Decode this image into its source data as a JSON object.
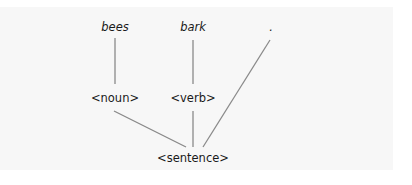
{
  "diagram": {
    "type": "parse-tree",
    "colors": {
      "background": "#ffffff",
      "panel": "#f7f7f7",
      "edge": "#8a8a8a",
      "text": "#1a1a1a"
    },
    "nodes": {
      "bees": {
        "label": "bees",
        "kind": "word",
        "x": 115,
        "y": 21
      },
      "bark": {
        "label": "bark",
        "kind": "word",
        "x": 193,
        "y": 21
      },
      "period": {
        "label": ".",
        "kind": "word",
        "x": 271,
        "y": 21
      },
      "noun": {
        "label": "<noun>",
        "kind": "category",
        "x": 115,
        "y": 92
      },
      "verb": {
        "label": "<verb>",
        "kind": "category",
        "x": 193,
        "y": 92
      },
      "sentence": {
        "label": "<sentence>",
        "kind": "category",
        "x": 193,
        "y": 152
      }
    },
    "edges": [
      {
        "from": "bees",
        "to": "noun",
        "x1": 115,
        "y1": 38,
        "x2": 115,
        "y2": 84
      },
      {
        "from": "bark",
        "to": "verb",
        "x1": 193,
        "y1": 40,
        "x2": 193,
        "y2": 84
      },
      {
        "from": "noun",
        "to": "sentence",
        "x1": 114,
        "y1": 111,
        "x2": 186,
        "y2": 147
      },
      {
        "from": "verb",
        "to": "sentence",
        "x1": 193,
        "y1": 111,
        "x2": 193,
        "y2": 147
      },
      {
        "from": "period",
        "to": "sentence",
        "x1": 270,
        "y1": 40,
        "x2": 203,
        "y2": 147
      }
    ]
  }
}
